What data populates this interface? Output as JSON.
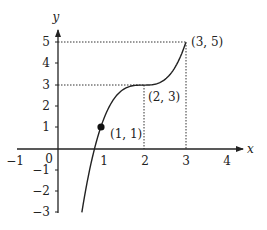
{
  "chart_data": {
    "type": "line",
    "title": "",
    "xlabel": "x",
    "ylabel": "y",
    "xlim": [
      -1.2,
      4.4
    ],
    "ylim": [
      -3,
      5.4
    ],
    "x_ticks": [
      "-1",
      "0",
      "1",
      "2",
      "3",
      "4"
    ],
    "y_ticks": [
      "5",
      "4",
      "3",
      "2",
      "1",
      "-1",
      "-2",
      "-3"
    ],
    "origin_label": "0",
    "grid": false,
    "curve": {
      "description": "cubic y = 2(x-2)^3 + 3, drawn from y=-3 to x=3",
      "x_range": [
        0.56,
        3.0
      ]
    },
    "points": [
      {
        "x": 1,
        "y": 1,
        "label": "(1, 1)",
        "marked": true
      },
      {
        "x": 2,
        "y": 3,
        "label": "(2, 3)",
        "marked": false
      },
      {
        "x": 3,
        "y": 5,
        "label": "(3, 5)",
        "marked": false
      }
    ],
    "guides": [
      {
        "from": [
          0,
          5
        ],
        "to": [
          3,
          5
        ],
        "style": "dotted"
      },
      {
        "from": [
          0,
          3
        ],
        "to": [
          2,
          3
        ],
        "style": "dotted"
      },
      {
        "from": [
          2,
          3
        ],
        "to": [
          2,
          0
        ],
        "style": "dotted"
      },
      {
        "from": [
          3,
          5
        ],
        "to": [
          3,
          0
        ],
        "style": "dotted"
      }
    ]
  },
  "labels": {
    "x_axis": "x",
    "y_axis": "y",
    "origin": "0",
    "xt_m1": "−1",
    "xt_1": "1",
    "xt_2": "2",
    "xt_3": "3",
    "xt_4": "4",
    "yt_5": "5",
    "yt_4": "4",
    "yt_3": "3",
    "yt_2": "2",
    "yt_1": "1",
    "yt_m1": "−1",
    "yt_m2": "−2",
    "yt_m3": "−3",
    "p1": "(1, 1)",
    "p2": "(2, 3)",
    "p3": "(3, 5)"
  }
}
